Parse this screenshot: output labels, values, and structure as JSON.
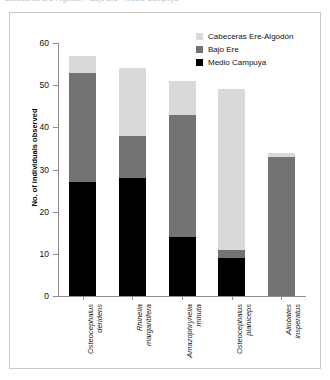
{
  "top_text": "Cabeceras Ere-Algodón   ·   Bajo Ere   ·   Medio Campuya",
  "legend": {
    "items": [
      {
        "label": "Cabeceras Ere-Algodón",
        "color": "#d9d9d9",
        "key": "cabeceras"
      },
      {
        "label": "Bajo Ere",
        "color": "#737373",
        "key": "bajo"
      },
      {
        "label": "Medio Campuya",
        "color": "#000000",
        "key": "medio"
      }
    ]
  },
  "chart_data": {
    "type": "bar",
    "stacked": true,
    "title": "",
    "xlabel": "",
    "ylabel": "No. of individuals observed",
    "ylim": [
      0,
      60
    ],
    "yticks": [
      0,
      10,
      20,
      30,
      40,
      50,
      60
    ],
    "ytick_labels": [
      "0",
      "10",
      "20",
      "30",
      "40",
      "50",
      "60"
    ],
    "grid": false,
    "legend_position": "top-right",
    "categories": [
      "Osteocephalus deridens",
      "Rhinella margaritifera",
      "Amazophrynella minuta",
      "Osteocephalus planiceps",
      "Allobates insperatus"
    ],
    "category_lines": [
      [
        "Osteocephalus",
        "deridens"
      ],
      [
        "Rhinella",
        "margaritifera"
      ],
      [
        "Amazophrynella",
        "minuta"
      ],
      [
        "Osteocephalus",
        "planiceps"
      ],
      [
        "Allobates",
        "insperatus"
      ]
    ],
    "series": [
      {
        "name": "Medio Campuya",
        "color": "#000000",
        "values": [
          27,
          28,
          14,
          9,
          0
        ]
      },
      {
        "name": "Bajo Ere",
        "color": "#737373",
        "values": [
          26,
          10,
          29,
          2,
          33
        ]
      },
      {
        "name": "Cabeceras Ere-Algodón",
        "color": "#d9d9d9",
        "values": [
          4,
          16,
          8,
          38,
          1
        ]
      }
    ],
    "totals": [
      57,
      54,
      51,
      49,
      34
    ]
  }
}
